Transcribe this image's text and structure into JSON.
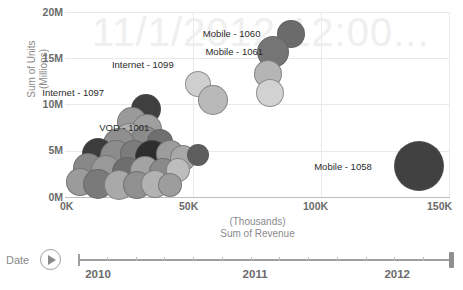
{
  "chart_data": {
    "type": "scatter",
    "subtype": "bubble",
    "title": "",
    "watermark": "11/1/2012 12:00...",
    "xlabel_top": "(Thousands)",
    "xlabel": "Sum of Revenue",
    "ylabel": "Sum of Units",
    "ylabel_unit": "(Millions)",
    "xticks": [
      "0K",
      "50K",
      "100K",
      "150K"
    ],
    "xtick_values": [
      0,
      50000,
      100000,
      150000
    ],
    "yticks": [
      "0M",
      "5M",
      "10M",
      "15M",
      "20M"
    ],
    "ytick_values": [
      0,
      5000000,
      10000000,
      15000000,
      20000000
    ],
    "xlim": [
      0,
      150000
    ],
    "ylim": [
      0,
      20000000
    ],
    "grid": true,
    "legend": "none",
    "annotations": [
      {
        "label": "Mobile - 1060",
        "x": 88000,
        "y": 17600
      },
      {
        "label": "Mobile - 1061",
        "x": 82000,
        "y": 15700
      },
      {
        "label": "Internet - 1099",
        "x": 51000,
        "y": 12500
      },
      {
        "label": "Internet - 1097",
        "x": 27000,
        "y": 9700
      },
      {
        "label": "VOD - 1001",
        "x": 25000,
        "y": 5900
      },
      {
        "label": "Mobile - 1058",
        "x": 138000,
        "y": 3300
      }
    ],
    "points": [
      {
        "x": 88000,
        "y": 17600,
        "size": 14,
        "color": "#6b6b6b",
        "label": "Mobile - 1060"
      },
      {
        "x": 81000,
        "y": 15700,
        "size": 16,
        "color": "#757575",
        "label": "Mobile - 1061"
      },
      {
        "x": 79000,
        "y": 13300,
        "size": 14,
        "color": "#b5b5b5",
        "label": ""
      },
      {
        "x": 80000,
        "y": 11200,
        "size": 14,
        "color": "#d2d2d2",
        "label": ""
      },
      {
        "x": 52000,
        "y": 12200,
        "size": 13,
        "color": "#cfcfcf",
        "label": "Internet - 1099"
      },
      {
        "x": 57500,
        "y": 10500,
        "size": 15,
        "color": "#b9b9b9",
        "label": ""
      },
      {
        "x": 31500,
        "y": 9500,
        "size": 15,
        "color": "#3f3f3f",
        "label": "Internet - 1097"
      },
      {
        "x": 26000,
        "y": 8100,
        "size": 15,
        "color": "#9a9a9a",
        "label": ""
      },
      {
        "x": 32000,
        "y": 7300,
        "size": 15,
        "color": "#9f9f9f",
        "label": ""
      },
      {
        "x": 25000,
        "y": 6400,
        "size": 15,
        "color": "#b0b0b0",
        "label": ""
      },
      {
        "x": 31000,
        "y": 6100,
        "size": 15,
        "color": "#8b8b8b",
        "label": ""
      },
      {
        "x": 21000,
        "y": 5700,
        "size": 16,
        "color": "#8f8f8f",
        "label": "VOD - 1001"
      },
      {
        "x": 37000,
        "y": 6000,
        "size": 13,
        "color": "#707070",
        "label": ""
      },
      {
        "x": 13000,
        "y": 4700,
        "size": 16,
        "color": "#3c3c3c",
        "label": ""
      },
      {
        "x": 20000,
        "y": 4400,
        "size": 16,
        "color": "#8c8c8c",
        "label": ""
      },
      {
        "x": 27000,
        "y": 4600,
        "size": 14,
        "color": "#7c7c7c",
        "label": ""
      },
      {
        "x": 34000,
        "y": 4300,
        "size": 17,
        "color": "#2d2d2d",
        "label": ""
      },
      {
        "x": 41000,
        "y": 4600,
        "size": 14,
        "color": "#9c9c9c",
        "label": ""
      },
      {
        "x": 46000,
        "y": 4200,
        "size": 13,
        "color": "#a8a8a8",
        "label": ""
      },
      {
        "x": 52000,
        "y": 4500,
        "size": 11,
        "color": "#5e5e5e",
        "label": ""
      },
      {
        "x": 9000,
        "y": 3100,
        "size": 15,
        "color": "#888888",
        "label": ""
      },
      {
        "x": 16000,
        "y": 2900,
        "size": 15,
        "color": "#999999",
        "label": ""
      },
      {
        "x": 24000,
        "y": 2700,
        "size": 15,
        "color": "#6e6e6e",
        "label": ""
      },
      {
        "x": 31000,
        "y": 2800,
        "size": 15,
        "color": "#a3a3a3",
        "label": ""
      },
      {
        "x": 38000,
        "y": 2700,
        "size": 14,
        "color": "#8a8a8a",
        "label": ""
      },
      {
        "x": 44000,
        "y": 2900,
        "size": 12,
        "color": "#bdbdbd",
        "label": ""
      },
      {
        "x": 6000,
        "y": 1600,
        "size": 14,
        "color": "#9b9b9b",
        "label": ""
      },
      {
        "x": 13000,
        "y": 1400,
        "size": 15,
        "color": "#7a7a7a",
        "label": ""
      },
      {
        "x": 21000,
        "y": 1300,
        "size": 15,
        "color": "#a9a9a9",
        "label": ""
      },
      {
        "x": 28000,
        "y": 1300,
        "size": 14,
        "color": "#909090",
        "label": ""
      },
      {
        "x": 35000,
        "y": 1400,
        "size": 14,
        "color": "#b2b2b2",
        "label": ""
      },
      {
        "x": 41000,
        "y": 1300,
        "size": 12,
        "color": "#9d9d9d",
        "label": ""
      },
      {
        "x": 138000,
        "y": 3300,
        "size": 25,
        "color": "#414141",
        "label": "Mobile - 1058"
      }
    ]
  },
  "timeline": {
    "label": "Date",
    "play_icon": "play-icon",
    "years": [
      "2010",
      "2011",
      "2012"
    ],
    "year_positions": [
      0,
      0.42,
      0.8
    ],
    "handle_position": 1.0,
    "tick_count": 13
  },
  "colors": {
    "axis_text": "#6b6b6b",
    "axis_title": "#8a8a8a",
    "gridline": "#e9e9e9",
    "watermark": "#efefef",
    "label_text": "#2b2b2b"
  }
}
